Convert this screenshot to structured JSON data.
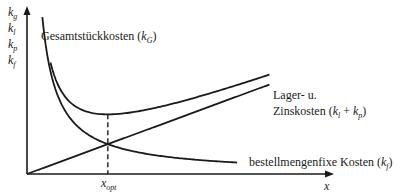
{
  "chart_data": {
    "type": "line",
    "title": "",
    "xlabel": "x",
    "ylabel_lines": [
      "k_g",
      "k_l",
      "k_p",
      "k_f"
    ],
    "x_tick_label": "x_opt",
    "x_opt": 1.0,
    "xlim": [
      0,
      3.7
    ],
    "ylim": [
      0,
      2.2
    ],
    "grid": false,
    "legend": "none",
    "series": [
      {
        "name": "Gesamtstückkosten (k_G)",
        "label_main": "Gesamtstückkosten (",
        "label_var": "k",
        "label_sub": "G",
        "label_end": ")",
        "shape": "total = fixed + linear"
      },
      {
        "name": "Lager- u. Zinskosten (k_l + k_p)",
        "label_line1": "Lager- u.",
        "label_line2_main": "Zinskosten (",
        "shape": "linear increasing from origin"
      },
      {
        "name": "bestellmengenfixe Kosten (k_f)",
        "label_main": "bestellmengenfixe Kosten (",
        "label_var": "k",
        "label_sub": "f",
        "label_end": ")",
        "shape": "hyperbolic decreasing"
      }
    ],
    "annotations": [
      "dashed vertical line at x_opt from x-axis to minimum of total cost curve"
    ]
  }
}
